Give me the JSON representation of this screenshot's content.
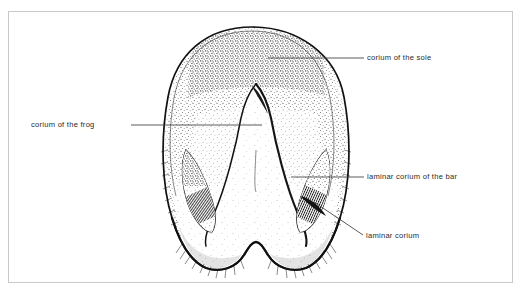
{
  "figure": {
    "frame_color": "#c9c9c9",
    "ink_color": "#111111",
    "background": "#ffffff",
    "text_color": "#2b2b2b"
  },
  "labels": [
    {
      "id": "corium-of-the-sole",
      "text": "corium of the sole",
      "leader": "horizontal",
      "side": "right"
    },
    {
      "id": "corium-of-the-frog",
      "text": "corium of the frog",
      "leader": "horizontal",
      "side": "left"
    },
    {
      "id": "laminar-corium-of-the-bar",
      "text": "laminar corium of the bar",
      "leader": "horizontal",
      "side": "right"
    },
    {
      "id": "laminar-corium",
      "text": "laminar corium",
      "leader": "diagonal",
      "side": "right"
    }
  ]
}
